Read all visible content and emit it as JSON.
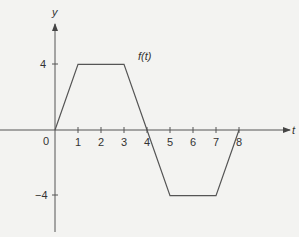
{
  "chart_data": {
    "type": "line",
    "title": "",
    "xlabel": "t",
    "ylabel": "y",
    "series": [
      {
        "name": "f(t)",
        "x": [
          0,
          1,
          3,
          4,
          5,
          7,
          8
        ],
        "y": [
          0,
          4,
          4,
          0,
          -4,
          -4,
          0
        ]
      }
    ],
    "x_ticks": [
      0,
      1,
      2,
      3,
      4,
      5,
      6,
      7,
      8
    ],
    "y_ticks": [
      4,
      -4
    ],
    "xlim": [
      -2.4,
      10.5
    ],
    "ylim": [
      -6.4,
      7
    ],
    "grid": false,
    "annotations": [
      {
        "text": "f(t)",
        "x": 4.2,
        "y": 4.4
      }
    ]
  },
  "labels": {
    "y_axis": "y",
    "x_axis": "t",
    "origin": "0",
    "curve": "f(t)",
    "x_ticks": [
      "1",
      "2",
      "3",
      "4",
      "5",
      "6",
      "7",
      "8"
    ],
    "y_pos": "4",
    "y_neg": "−4"
  }
}
